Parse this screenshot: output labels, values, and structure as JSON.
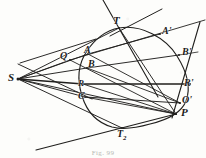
{
  "figure": {
    "caption": "Fig. 99",
    "ink_color": "#201f1d",
    "paper_color": "#fdfdfb",
    "width": 206,
    "height": 158
  },
  "labels": [
    {
      "id": "S",
      "text": "S",
      "sub": "",
      "x": 8,
      "y": 72,
      "size": 11
    },
    {
      "id": "Q",
      "text": "Q",
      "sub": "",
      "x": 60,
      "y": 51,
      "size": 10
    },
    {
      "id": "A",
      "text": "A",
      "sub": "",
      "x": 84,
      "y": 45,
      "size": 10
    },
    {
      "id": "B",
      "text": "B",
      "sub": "",
      "x": 88,
      "y": 59,
      "size": 10
    },
    {
      "id": "R",
      "text": "R",
      "sub": "",
      "x": 78,
      "y": 79,
      "size": 9
    },
    {
      "id": "C",
      "text": "C",
      "sub": "",
      "x": 78,
      "y": 91,
      "size": 10
    },
    {
      "id": "T",
      "text": "T",
      "sub": "",
      "x": 113,
      "y": 15,
      "size": 11
    },
    {
      "id": "T2",
      "text": "T",
      "sub": "2",
      "x": 117,
      "y": 129,
      "size": 10
    },
    {
      "id": "Ap",
      "text": "A'",
      "sub": "",
      "x": 162,
      "y": 26,
      "size": 10
    },
    {
      "id": "Bp",
      "text": "B'",
      "sub": "",
      "x": 182,
      "y": 47,
      "size": 10
    },
    {
      "id": "Rp",
      "text": "R'",
      "sub": "",
      "x": 184,
      "y": 78,
      "size": 10
    },
    {
      "id": "Op",
      "text": "O'",
      "sub": "",
      "x": 182,
      "y": 95,
      "size": 10
    },
    {
      "id": "P",
      "text": "P",
      "sub": "",
      "x": 181,
      "y": 107,
      "size": 11
    }
  ],
  "points": {
    "S": {
      "x": 18,
      "y": 79
    },
    "Q": {
      "x": 70,
      "y": 60
    },
    "A": {
      "x": 88,
      "y": 54
    },
    "B": {
      "x": 87,
      "y": 68
    },
    "R": {
      "x": 83,
      "y": 84
    },
    "C": {
      "x": 85,
      "y": 97
    },
    "T": {
      "x": 119,
      "y": 28
    },
    "T2": {
      "x": 122,
      "y": 128
    },
    "Ap": {
      "x": 160,
      "y": 34
    },
    "Bp": {
      "x": 179,
      "y": 55
    },
    "Rp": {
      "x": 190,
      "y": 84
    },
    "Op": {
      "x": 180,
      "y": 103
    },
    "P": {
      "x": 176,
      "y": 114
    }
  },
  "oval": {
    "cx": 135,
    "cy": 78,
    "rx": 54,
    "ry": 53,
    "description": "closed oval / conic section"
  },
  "rays_from_S": [
    "S-A-Ap",
    "S-B-Bp",
    "S-R-Rp",
    "S-C-Op",
    "S-P",
    "S-T",
    "S-T2",
    "S-Q"
  ],
  "chords": [
    "T-P",
    "Q-P",
    "A-Op",
    "B-Op",
    "C-P"
  ],
  "tangents": [
    "tangent-at-T",
    "tangent-at-T2",
    "tangent-at-P"
  ]
}
